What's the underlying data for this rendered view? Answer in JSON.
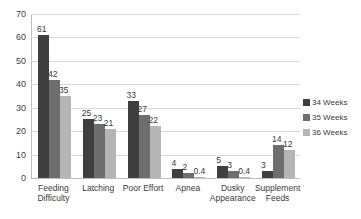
{
  "chart_data": {
    "type": "bar",
    "title": "",
    "subtitle": "",
    "xlabel": "",
    "ylabel": "",
    "ylim": [
      0,
      70
    ],
    "ytick_step": 10,
    "yticks": [
      "0",
      "10",
      "20",
      "30",
      "40",
      "50",
      "60",
      "70"
    ],
    "grid": true,
    "legend_position": "right",
    "categories": [
      "Feeding\nDifficulty",
      "Latching",
      "Poor Effort",
      "Apnea",
      "Dusky\nAppearance",
      "Supplement\nFeeds"
    ],
    "series": [
      {
        "name": "34 Weeks",
        "color": "#3f3f3f",
        "values": [
          61,
          25,
          33,
          4,
          5,
          3
        ],
        "labels": [
          "61",
          "25",
          "33",
          "4",
          "5",
          "3"
        ]
      },
      {
        "name": "35 Weeks",
        "color": "#6e6e6e",
        "values": [
          42,
          23,
          27,
          2,
          3,
          14
        ],
        "labels": [
          "42",
          "23",
          "27",
          "2",
          "3",
          "14"
        ]
      },
      {
        "name": "36 Weeks",
        "color": "#b5b5b5",
        "values": [
          35,
          21,
          22,
          0.4,
          0.4,
          12
        ],
        "labels": [
          "35",
          "21",
          "22",
          "0.4",
          "0.4",
          "12"
        ]
      }
    ]
  },
  "legend": {
    "items": [
      {
        "label": "34 Weeks",
        "color": "#3f3f3f"
      },
      {
        "label": "35 Weeks",
        "color": "#6e6e6e"
      },
      {
        "label": "36 Weeks",
        "color": "#b5b5b5"
      }
    ]
  }
}
